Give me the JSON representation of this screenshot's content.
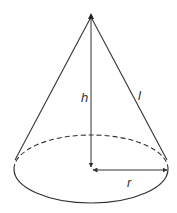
{
  "diagram": {
    "labels": {
      "height": "h",
      "slant": "l",
      "radius": "r"
    },
    "colors": {
      "stroke": "#333333",
      "background": "#ffffff"
    },
    "geometry": {
      "apex": [
        91,
        17
      ],
      "base_center": [
        91,
        169
      ],
      "base_rx": 77,
      "base_ry": 34
    }
  }
}
